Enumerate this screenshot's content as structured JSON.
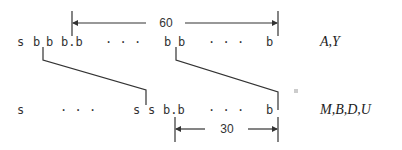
{
  "diagram": {
    "top_row": {
      "tokens": [
        "s",
        "b",
        "b",
        "b.b",
        "· · ·",
        "b",
        "b",
        "· · ·",
        "b"
      ],
      "label": "A,Y"
    },
    "bottom_row": {
      "tokens": [
        "s",
        "· · ·",
        "s",
        "s",
        "b.b",
        "· · ·",
        "b"
      ],
      "label": "M,B,D,U"
    },
    "dimension_top": {
      "value": "60"
    },
    "dimension_bottom": {
      "value": "30"
    },
    "colors": {
      "ink": "#333333",
      "background": "#ffffff"
    }
  }
}
